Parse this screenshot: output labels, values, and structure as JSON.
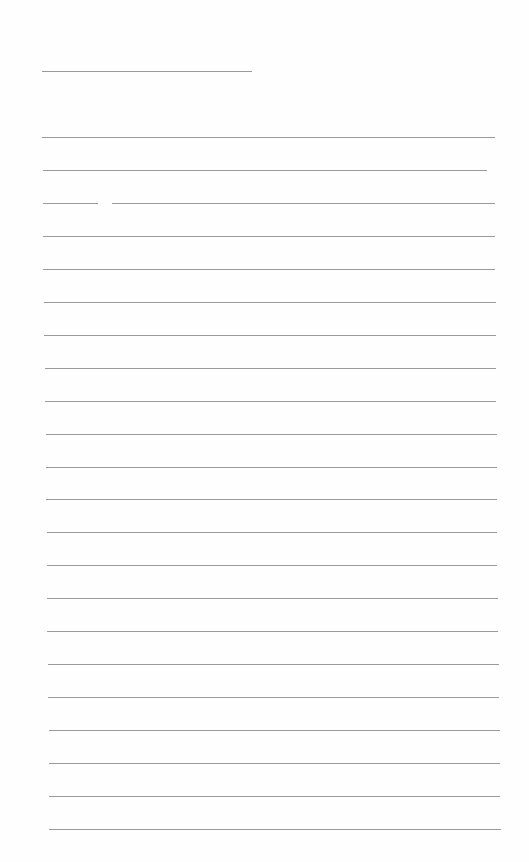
{
  "document": {
    "type": "lined-paper",
    "line_color": "#9a9a9a",
    "background": "#fefefe",
    "header_line": {
      "y": 71,
      "x1": 42,
      "x2": 252
    },
    "rules": [
      {
        "y": 137,
        "x1": 42,
        "x2": 495
      },
      {
        "y": 170,
        "x1": 43,
        "x2": 487
      },
      {
        "y": 203,
        "x1": 43,
        "x2": 98,
        "gap_end": 112,
        "x3": 495
      },
      {
        "y": 236,
        "x1": 43,
        "x2": 495
      },
      {
        "y": 269,
        "x1": 43,
        "x2": 495
      },
      {
        "y": 302,
        "x1": 44,
        "x2": 496
      },
      {
        "y": 335,
        "x1": 44,
        "x2": 496
      },
      {
        "y": 368,
        "x1": 45,
        "x2": 496
      },
      {
        "y": 401,
        "x1": 45,
        "x2": 496
      },
      {
        "y": 434,
        "x1": 46,
        "x2": 497
      },
      {
        "y": 467,
        "x1": 46,
        "x2": 497
      },
      {
        "y": 499,
        "x1": 46,
        "x2": 497
      },
      {
        "y": 532,
        "x1": 47,
        "x2": 497
      },
      {
        "y": 565,
        "x1": 47,
        "x2": 497
      },
      {
        "y": 598,
        "x1": 47,
        "x2": 498
      },
      {
        "y": 631,
        "x1": 47,
        "x2": 498
      },
      {
        "y": 664,
        "x1": 48,
        "x2": 499
      },
      {
        "y": 697,
        "x1": 48,
        "x2": 499
      },
      {
        "y": 730,
        "x1": 49,
        "x2": 500
      },
      {
        "y": 763,
        "x1": 49,
        "x2": 500
      },
      {
        "y": 796,
        "x1": 49,
        "x2": 500
      },
      {
        "y": 829,
        "x1": 49,
        "x2": 501
      }
    ]
  }
}
